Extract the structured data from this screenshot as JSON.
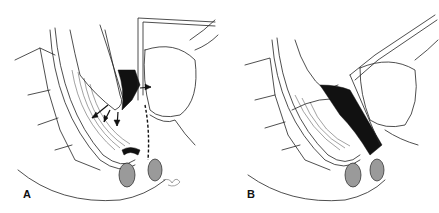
{
  "figure": {
    "panels": [
      {
        "id": "A",
        "label": "A"
      },
      {
        "id": "B",
        "label": "B"
      }
    ],
    "colors": {
      "line": "#222222",
      "fill_dark": "#111111",
      "shade": "#9a9a9a",
      "background": "#ffffff"
    }
  }
}
